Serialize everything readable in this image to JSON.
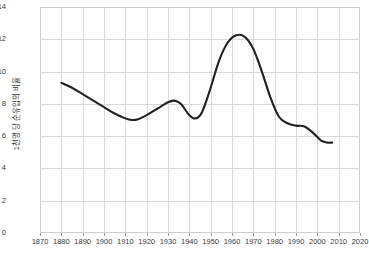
{
  "chart_data": {
    "type": "line",
    "title": "",
    "subtitle": "",
    "xlabel": "",
    "ylabel": "1천명 당 순유입의 비율",
    "xlim": [
      1870,
      2020
    ],
    "ylim": [
      0,
      14
    ],
    "xticks": [
      1870,
      1880,
      1890,
      1900,
      1910,
      1920,
      1930,
      1940,
      1950,
      1960,
      1970,
      1980,
      1990,
      2000,
      2010,
      2020
    ],
    "yticks": [
      0,
      2,
      4,
      6,
      8,
      10,
      12,
      14
    ],
    "grid": true,
    "legend": "none",
    "series": [
      {
        "name": "순유입 비율",
        "color": "#222222",
        "x": [
          1880,
          1885,
          1890,
          1895,
          1900,
          1905,
          1910,
          1913,
          1916,
          1920,
          1925,
          1930,
          1933,
          1936,
          1940,
          1943,
          1946,
          1950,
          1954,
          1958,
          1962,
          1966,
          1970,
          1974,
          1978,
          1982,
          1986,
          1990,
          1994,
          1998,
          2002,
          2005,
          2007
        ],
        "y": [
          9.3,
          9.0,
          8.6,
          8.2,
          7.8,
          7.4,
          7.1,
          7.0,
          7.05,
          7.3,
          7.7,
          8.1,
          8.2,
          8.0,
          7.3,
          7.1,
          7.5,
          9.0,
          10.7,
          11.8,
          12.25,
          12.15,
          11.4,
          10.0,
          8.4,
          7.2,
          6.8,
          6.65,
          6.6,
          6.2,
          5.7,
          5.6,
          5.6
        ]
      }
    ]
  },
  "axis": {
    "y_tick_labels": [
      "0",
      "2",
      "4",
      "6",
      "8",
      "10",
      "12",
      "14"
    ],
    "x_tick_labels": [
      "1870",
      "1880",
      "1890",
      "1900",
      "1910",
      "1920",
      "1930",
      "1940",
      "1950",
      "1960",
      "1970",
      "1980",
      "1990",
      "2000",
      "2010",
      "2020"
    ],
    "y_axis_title": "1천명 당 순유입의 비율"
  },
  "colors": {
    "line": "#222222",
    "grid": "#d9d9d9",
    "frame": "#cfcfcf",
    "text": "#3a3a3a",
    "background": "#ffffff"
  }
}
